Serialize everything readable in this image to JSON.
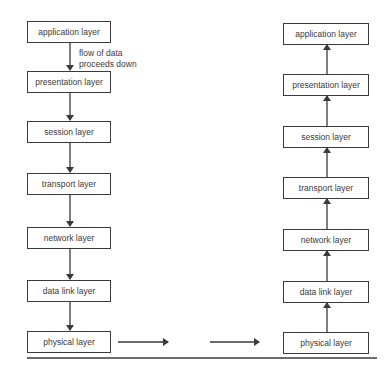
{
  "sender_stack": {
    "layers": [
      {
        "label": "application layer"
      },
      {
        "label": "presentation layer"
      },
      {
        "label": "session layer"
      },
      {
        "label": "transport layer"
      },
      {
        "label": "network layer"
      },
      {
        "label": "data link layer"
      },
      {
        "label": "physical layer"
      }
    ],
    "annotation_line1": "flow of data",
    "annotation_line2": "proceeds down"
  },
  "receiver_stack": {
    "layers": [
      {
        "label": "application layer"
      },
      {
        "label": "presentation layer"
      },
      {
        "label": "session layer"
      },
      {
        "label": "transport layer"
      },
      {
        "label": "network layer"
      },
      {
        "label": "data link layer"
      },
      {
        "label": "physical layer"
      }
    ]
  },
  "colors": {
    "line": "#3a3a3a",
    "background": "#ffffff"
  }
}
